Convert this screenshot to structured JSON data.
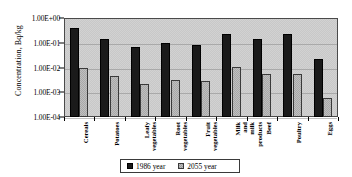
{
  "chart_data": {
    "type": "bar",
    "title": "",
    "xlabel": "",
    "ylabel": "Concentration, Bq/kg",
    "yscale": "log",
    "ylim": [
      0.0001,
      1
    ],
    "ytick_labels": [
      "1.00E+00",
      "1.00E-01",
      "1.00E-02",
      "1.00E-03",
      "1.00E-04"
    ],
    "ytick_values": [
      1,
      0.1,
      0.01,
      0.001,
      0.0001
    ],
    "grid": true,
    "legend_position": "bottom",
    "categories": [
      "Cereals",
      "Potatoes",
      "Leafy vegetables",
      "Root vegetables",
      "Fruit vegetables",
      "Milk and milk products",
      "Beef",
      "Poultry",
      "Eggs"
    ],
    "series": [
      {
        "name": "1986 year",
        "color": "#1a1a1a",
        "values": [
          0.38,
          0.14,
          0.07,
          0.1,
          0.085,
          0.22,
          0.14,
          0.23,
          0.022
        ]
      },
      {
        "name": "2055 year",
        "color": "#bfbfbf",
        "values": [
          0.0095,
          0.0045,
          0.0022,
          0.0032,
          0.0028,
          0.0105,
          0.0055,
          0.0055,
          0.0006
        ]
      }
    ]
  }
}
